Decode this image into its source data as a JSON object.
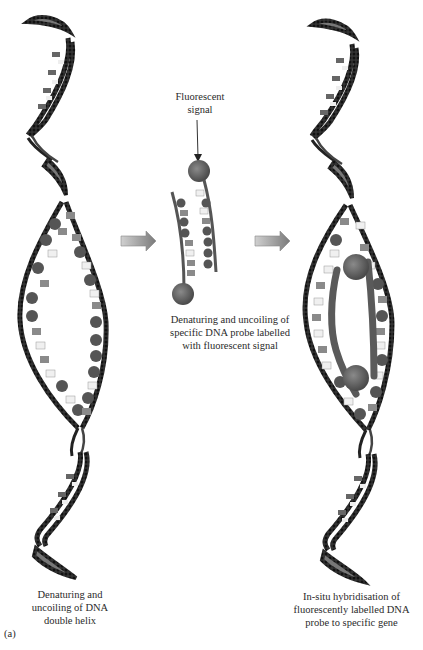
{
  "figure": {
    "panel_label": "(a)",
    "colors": {
      "backbone": "#1a1a1a",
      "base_dark": "#5a5a5a",
      "base_mid": "#8a8a8a",
      "base_light": "#e8e8e8",
      "probe": "#555555",
      "arrow": "#9a9a9a"
    }
  },
  "stages": [
    {
      "id": "left",
      "caption_lines": [
        "Denaturing and",
        "uncoiling of DNA",
        "double helix"
      ]
    },
    {
      "id": "middle",
      "callout_lines": [
        "Fluorescent",
        "signal"
      ],
      "caption_lines": [
        "Denaturing and uncoiling of",
        "specific DNA probe labelled",
        "with fluorescent signal"
      ]
    },
    {
      "id": "right",
      "caption_lines": [
        "In-situ hybridisation of",
        "fluorescently labelled DNA",
        "probe to specific gene"
      ]
    }
  ],
  "arrows": [
    {
      "name": "step-arrow-1"
    },
    {
      "name": "step-arrow-2"
    }
  ]
}
